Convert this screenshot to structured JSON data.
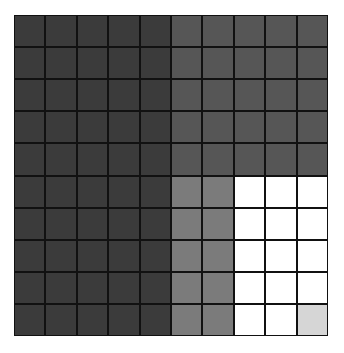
{
  "diagram": {
    "type": "grid-model",
    "rows": 10,
    "cols": 10,
    "palette": {
      "dark": "#3b3b3b",
      "medium_dark": "#565656",
      "medium": "#7b7b7b",
      "white": "#ffffff",
      "light": "#d6d6d6",
      "line": "#111111"
    },
    "cells": [
      [
        "dark",
        "dark",
        "dark",
        "dark",
        "dark",
        "medium_dark",
        "medium_dark",
        "medium_dark",
        "medium_dark",
        "medium_dark"
      ],
      [
        "dark",
        "dark",
        "dark",
        "dark",
        "dark",
        "medium_dark",
        "medium_dark",
        "medium_dark",
        "medium_dark",
        "medium_dark"
      ],
      [
        "dark",
        "dark",
        "dark",
        "dark",
        "dark",
        "medium_dark",
        "medium_dark",
        "medium_dark",
        "medium_dark",
        "medium_dark"
      ],
      [
        "dark",
        "dark",
        "dark",
        "dark",
        "dark",
        "medium_dark",
        "medium_dark",
        "medium_dark",
        "medium_dark",
        "medium_dark"
      ],
      [
        "dark",
        "dark",
        "dark",
        "dark",
        "dark",
        "medium_dark",
        "medium_dark",
        "medium_dark",
        "medium_dark",
        "medium_dark"
      ],
      [
        "dark",
        "dark",
        "dark",
        "dark",
        "dark",
        "medium",
        "medium",
        "white",
        "white",
        "white"
      ],
      [
        "dark",
        "dark",
        "dark",
        "dark",
        "dark",
        "medium",
        "medium",
        "white",
        "white",
        "white"
      ],
      [
        "dark",
        "dark",
        "dark",
        "dark",
        "dark",
        "medium",
        "medium",
        "white",
        "white",
        "white"
      ],
      [
        "dark",
        "dark",
        "dark",
        "dark",
        "dark",
        "medium",
        "medium",
        "white",
        "white",
        "white"
      ],
      [
        "dark",
        "dark",
        "dark",
        "dark",
        "dark",
        "medium",
        "medium",
        "white",
        "white",
        "light"
      ]
    ],
    "counts": {
      "dark": 50,
      "medium_dark": 25,
      "medium": 10,
      "white": 14,
      "light": 1
    }
  }
}
